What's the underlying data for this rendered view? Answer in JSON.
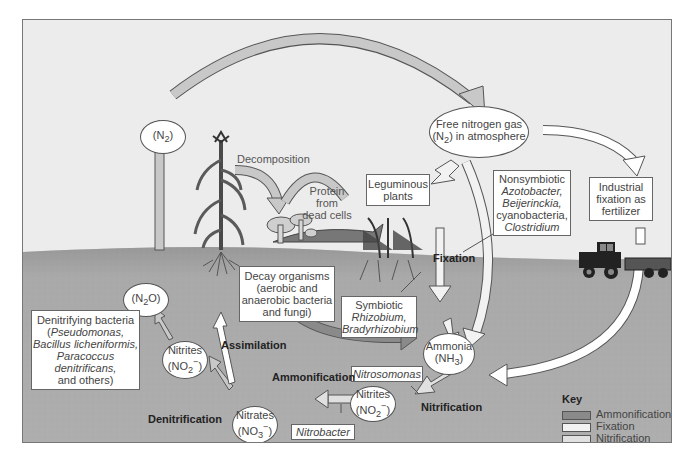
{
  "nodes": {
    "n2_left": {
      "text": "(N",
      "sub": "2",
      "tail": ")"
    },
    "free_n2": {
      "line1": "Free nitrogen gas",
      "line2a": "(N",
      "sub": "2",
      "line2b": ") in atmosphere"
    },
    "n2o": {
      "text": "(N",
      "sub": "2",
      "tail": "O)"
    },
    "nitrites_left": {
      "line1": "Nitrites",
      "line2a": "(NO",
      "sub": "2",
      "sup": "−",
      "line2b": ")"
    },
    "nitrates": {
      "line1": "Nitrates",
      "line2a": "(NO",
      "sub": "3",
      "sup": "−",
      "line2b": ")"
    },
    "ammonia": {
      "line1": "Ammonia",
      "line2a": "(NH",
      "sub": "3",
      "line2b": ")"
    },
    "nitrites_right": {
      "line1": "Nitrites",
      "line2a": "(NO",
      "sub": "2",
      "sup": "−",
      "line2b": ")"
    }
  },
  "boxes": {
    "leguminous": [
      "Leguminous",
      "plants"
    ],
    "nonsymbiotic": {
      "l1": "Nonsymbiotic",
      "l2": "Azotobacter,",
      "l3": "Beijerinckia,",
      "l4": "cyanobacteria,",
      "l5": "Clostridium"
    },
    "industrial": [
      "Industrial",
      "fixation as",
      "fertilizer"
    ],
    "decay": [
      "Decay organisms",
      "(aerobic and",
      "anaerobic bacteria",
      "and fungi)"
    ],
    "symbiotic": {
      "l1": "Symbiotic",
      "l2": "Rhizobium,",
      "l3": "Bradyrhizobium"
    },
    "denitrifying": {
      "l1": "Denitrifying bacteria",
      "l2a": "(",
      "l2": "Pseudomonas,",
      "l3": "Bacillus licheniformis,",
      "l4": "Paracoccus",
      "l5": "denitrificans,",
      "l6": "and others)"
    },
    "nitrosomonas": "Nitrosomonas",
    "nitrobacter": "Nitrobacter"
  },
  "labels": {
    "decomposition": "Decomposition",
    "protein": [
      "Protein",
      "from",
      "dead cells"
    ],
    "fixation": "Fixation",
    "assimilation": "Assimilation",
    "ammonification": "Ammonification",
    "denitrification": "Denitrification",
    "nitrification": "Nitrification"
  },
  "key": {
    "title": "Key",
    "items": [
      {
        "label": "Ammonification",
        "color": "#8a8a8a"
      },
      {
        "label": "Fixation",
        "color": "#f2f2f2"
      },
      {
        "label": "Nitrification",
        "color": "#e0e0e0"
      },
      {
        "label": "Denitrification",
        "color": "#c8c8c8"
      }
    ]
  },
  "colors": {
    "sky": "#ececec",
    "soil": "#a9a9a9",
    "arrow_denitrification": "#c8c8c8",
    "arrow_ammonification": "#8a8a8a"
  }
}
